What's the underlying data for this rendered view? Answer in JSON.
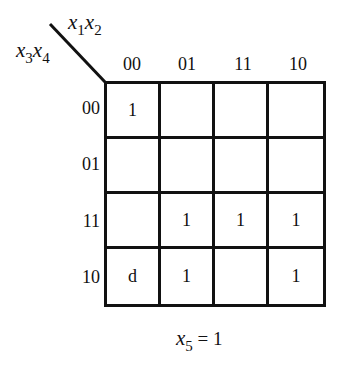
{
  "kmap": {
    "column_variables": {
      "a": "x",
      "a_sub": "1",
      "b": "x",
      "b_sub": "2"
    },
    "row_variables": {
      "a": "x",
      "a_sub": "3",
      "b": "x",
      "b_sub": "4"
    },
    "column_labels": [
      "00",
      "01",
      "11",
      "10"
    ],
    "row_labels": [
      "00",
      "01",
      "11",
      "10"
    ],
    "cells": [
      [
        "1",
        "",
        "",
        ""
      ],
      [
        "",
        "",
        "",
        ""
      ],
      [
        "",
        "1",
        "1",
        "1"
      ],
      [
        "d",
        "1",
        "",
        "1"
      ]
    ],
    "caption": {
      "var": "x",
      "sub": "5",
      "rest": " = 1"
    }
  },
  "colors": {
    "line": "#111111",
    "background": "#ffffff"
  }
}
